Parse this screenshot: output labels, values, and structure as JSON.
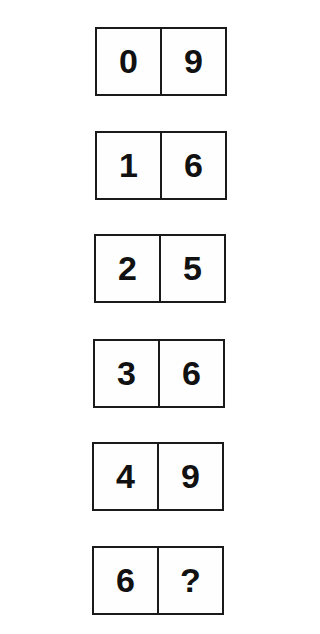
{
  "puzzle": {
    "tiles": [
      {
        "left": "0",
        "right": "9"
      },
      {
        "left": "1",
        "right": "6"
      },
      {
        "left": "2",
        "right": "5"
      },
      {
        "left": "3",
        "right": "6"
      },
      {
        "left": "4",
        "right": "9"
      },
      {
        "left": "6",
        "right": "?"
      }
    ]
  }
}
